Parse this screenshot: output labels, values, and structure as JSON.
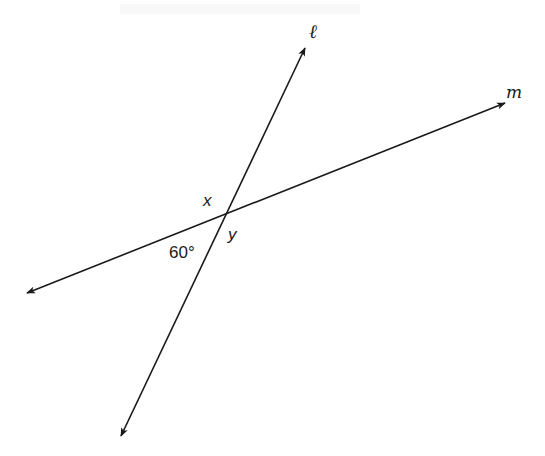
{
  "figure": {
    "intersection": {
      "x": 223,
      "y": 213
    },
    "lines": [
      {
        "name": "ℓ",
        "from": {
          "x": 121,
          "y": 436
        },
        "to": {
          "x": 305,
          "y": 48
        },
        "arrows": "both"
      },
      {
        "name": "m",
        "from": {
          "x": 27,
          "y": 293
        },
        "to": {
          "x": 505,
          "y": 103
        },
        "arrows": "both"
      }
    ],
    "labels": {
      "line_l": "ℓ",
      "line_m": "m",
      "angle_x": "x",
      "angle_y": "y",
      "angle_given": "60°"
    },
    "colors": {
      "stroke": "#1a1a1a",
      "background": "#ffffff"
    }
  }
}
